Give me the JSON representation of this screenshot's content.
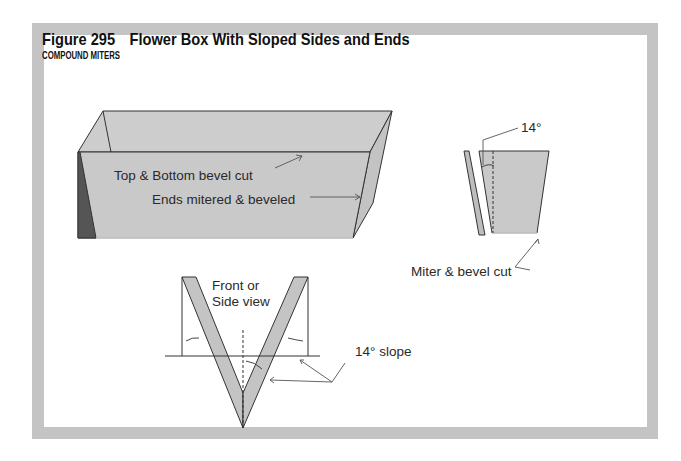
{
  "figure": {
    "number": "Figure 295",
    "title": "Flower Box With Sloped Sides and Ends",
    "subtitle": "COMPOUND MITERS"
  },
  "labels": {
    "box_top_bottom": "Top & Bottom bevel cut",
    "box_ends": "Ends mitered & beveled",
    "side_angle": "14°",
    "side_cut": "Miter & bevel cut",
    "view_line1": "Front or",
    "view_line2": "Side view",
    "slope": "14° slope"
  },
  "colors": {
    "frame": "#c4c4c4",
    "panel_fill": "#c9c9c9",
    "panel_dark": "#5a5a5a",
    "line": "#333333"
  }
}
